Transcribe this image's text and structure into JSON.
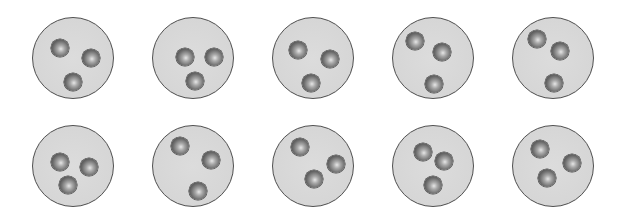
{
  "figure": {
    "colors": {
      "background": "#ffffff",
      "dish_fill": "#d8d8d8",
      "dish_border": "#4f4f4f",
      "ball_dark": "#3a3a3a",
      "ball_light": "#e6e6e6"
    },
    "dish_radius": 41,
    "ball_radius": 9,
    "dishes": [
      {
        "cx": 73,
        "cy": 58,
        "balls": [
          [
            60,
            48
          ],
          [
            91,
            58
          ],
          [
            73,
            82
          ]
        ]
      },
      {
        "cx": 193,
        "cy": 58,
        "balls": [
          [
            185,
            57
          ],
          [
            214,
            57
          ],
          [
            195,
            81
          ]
        ]
      },
      {
        "cx": 313,
        "cy": 58,
        "balls": [
          [
            298,
            50
          ],
          [
            330,
            59
          ],
          [
            311,
            83
          ]
        ]
      },
      {
        "cx": 433,
        "cy": 58,
        "balls": [
          [
            415,
            41
          ],
          [
            442,
            52
          ],
          [
            434,
            84
          ]
        ]
      },
      {
        "cx": 553,
        "cy": 58,
        "balls": [
          [
            537,
            39
          ],
          [
            560,
            51
          ],
          [
            554,
            83
          ]
        ]
      },
      {
        "cx": 73,
        "cy": 166,
        "balls": [
          [
            60,
            162
          ],
          [
            89,
            167
          ],
          [
            68,
            185
          ]
        ]
      },
      {
        "cx": 193,
        "cy": 166,
        "balls": [
          [
            180,
            146
          ],
          [
            211,
            160
          ],
          [
            198,
            191
          ]
        ]
      },
      {
        "cx": 313,
        "cy": 166,
        "balls": [
          [
            300,
            147
          ],
          [
            336,
            164
          ],
          [
            314,
            179
          ]
        ]
      },
      {
        "cx": 433,
        "cy": 166,
        "balls": [
          [
            423,
            152
          ],
          [
            444,
            161
          ],
          [
            433,
            185
          ]
        ]
      },
      {
        "cx": 553,
        "cy": 166,
        "balls": [
          [
            540,
            149
          ],
          [
            572,
            163
          ],
          [
            547,
            178
          ]
        ]
      }
    ]
  }
}
